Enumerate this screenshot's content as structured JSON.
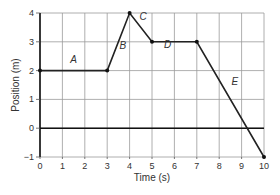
{
  "chart_data": {
    "type": "line",
    "title": "",
    "xlabel": "Time (s)",
    "ylabel": "Position (m)",
    "xlim": [
      0,
      10
    ],
    "ylim": [
      -1,
      4
    ],
    "x_ticks": [
      "0",
      "1",
      "2",
      "3",
      "4",
      "5",
      "6",
      "7",
      "8",
      "9",
      "10"
    ],
    "y_ticks": [
      "-1",
      "0",
      "1",
      "2",
      "3",
      "4"
    ],
    "grid": true,
    "series": [
      {
        "name": "position",
        "x": [
          0,
          3,
          4,
          5,
          7,
          10
        ],
        "y": [
          2,
          2,
          4,
          3,
          3,
          -1
        ]
      }
    ],
    "segment_labels": [
      {
        "label": "A",
        "x": 1.5,
        "y": 2.25
      },
      {
        "label": "B",
        "x": 3.7,
        "y": 2.75
      },
      {
        "label": "C",
        "x": 4.6,
        "y": 3.75
      },
      {
        "label": "D",
        "x": 5.7,
        "y": 2.8
      },
      {
        "label": "E",
        "x": 8.7,
        "y": 1.5
      }
    ]
  }
}
